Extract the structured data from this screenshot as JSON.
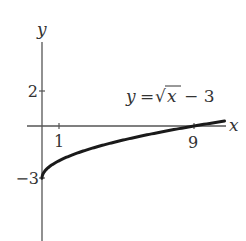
{
  "chart_data": {
    "type": "line",
    "title": "",
    "equation_label": "y = √x − 3",
    "equation_parts": {
      "lhs": "y",
      "eq": "=",
      "radical": "√",
      "radicand": "x",
      "rest": "− 3"
    },
    "xlabel": "x",
    "ylabel": "y",
    "x_ticks": [
      {
        "value": 1,
        "label": "1"
      },
      {
        "value": 9,
        "label": "9"
      }
    ],
    "y_ticks": [
      {
        "value": 2,
        "label": "2"
      },
      {
        "value": -3,
        "label": "−3"
      }
    ],
    "xlim": [
      -0.9,
      10.9
    ],
    "ylim": [
      -6.5,
      4.8
    ],
    "grid": false,
    "legend": "none",
    "series": [
      {
        "name": "y = √x − 3",
        "x": [
          0,
          0.25,
          0.5,
          1,
          2,
          3,
          4,
          5,
          6,
          7,
          8,
          9,
          10,
          10.8
        ],
        "values": [
          -3,
          -2.5,
          -2.29,
          -2,
          -1.59,
          -1.27,
          -1,
          -0.76,
          -0.55,
          -0.35,
          -0.17,
          0,
          0.16,
          0.29
        ]
      }
    ],
    "colors": {
      "axis": "#555555",
      "curve": "#1a1a1a",
      "text": "#333333"
    }
  }
}
